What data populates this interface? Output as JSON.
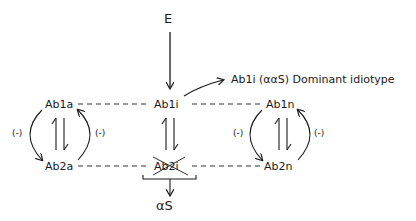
{
  "diagram": {
    "input_label": "E",
    "dominant_label": "Ab1i (ααS) Dominant idiotype",
    "output_label": "αS",
    "nodes": {
      "ab1a": "Ab1a",
      "ab1i": "Ab1i",
      "ab1n": "Ab1n",
      "ab2a": "Ab2a",
      "ab2i": "Ab2i",
      "ab2n": "Ab2n"
    },
    "inhibition_labels": {
      "left_outer": "(-)",
      "left_inner": "(-)",
      "right_inner": "(-)",
      "right_outer": "(-)"
    },
    "crossed_out_node": "Ab2i",
    "line_color": "#1a1a1a",
    "background": "#ffffff"
  }
}
